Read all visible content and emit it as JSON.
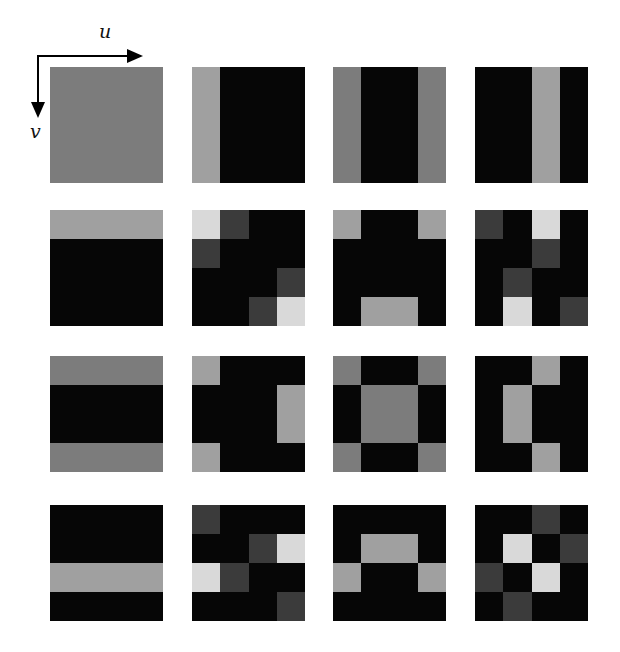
{
  "axes": {
    "u_label": "u",
    "v_label": "v"
  },
  "palette": {
    "B": "#060606",
    "D": "#3b3b3b",
    "M": "#7c7c7c",
    "G": "#a0a0a0",
    "L": "#d9d9d9"
  },
  "grid": {
    "rows": 4,
    "cols": 4,
    "cells_per_tile": 4,
    "col_x": [
      50,
      192,
      333,
      475
    ],
    "row_y": [
      67,
      210,
      356,
      505
    ]
  },
  "tiles": [
    [
      [
        "MMMM",
        "MMMM",
        "MMMM",
        "MMMM"
      ],
      [
        "GBBB",
        "GBBB",
        "GBBB",
        "GBBB"
      ],
      [
        "MBBM",
        "MBBM",
        "MBBM",
        "MBBM"
      ],
      [
        "BBGB",
        "BBGB",
        "BBGB",
        "BBGB"
      ]
    ],
    [
      [
        "GGGG",
        "BBBB",
        "BBBB",
        "BBBB"
      ],
      [
        "LDBB",
        "DBBB",
        "BBBD",
        "BBDL"
      ],
      [
        "GBBG",
        "BBBB",
        "BBBB",
        "BGGB"
      ],
      [
        "DBLB",
        "BBDB",
        "BDBB",
        "BLBD"
      ]
    ],
    [
      [
        "MMMM",
        "BBBB",
        "BBBB",
        "MMMM"
      ],
      [
        "GBBB",
        "BBBG",
        "BBBG",
        "GBBB"
      ],
      [
        "MBBM",
        "BMMB",
        "BMMB",
        "MBBM"
      ],
      [
        "BBGB",
        "BGBB",
        "BGBB",
        "BBGB"
      ]
    ],
    [
      [
        "BBBB",
        "BBBB",
        "GGGG",
        "BBBB"
      ],
      [
        "DBBB",
        "BBDL",
        "LDBB",
        "BBBD"
      ],
      [
        "BBBB",
        "BGGB",
        "GBBG",
        "BBBB"
      ],
      [
        "BBDB",
        "BLBD",
        "DBLB",
        "BDBB"
      ]
    ]
  ]
}
